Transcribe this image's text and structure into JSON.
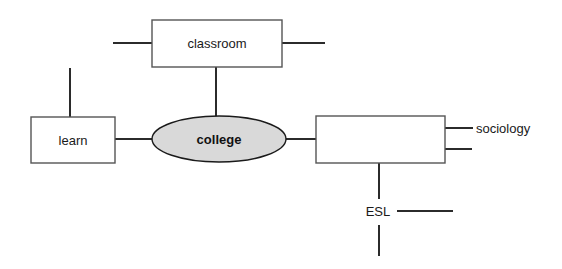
{
  "diagram": {
    "type": "concept-map",
    "canvas": {
      "width": 562,
      "height": 269,
      "background": "#ffffff"
    },
    "colors": {
      "node_fill": "#ffffff",
      "node_stroke": "#555555",
      "central_fill": "#d9d9d9",
      "central_stroke": "#1a1a1a",
      "connector": "#2b2b2b",
      "text": "#1a1a1a"
    },
    "nodes": [
      {
        "id": "classroom",
        "label": "classroom",
        "shape": "rectangle",
        "x": 152,
        "y": 20,
        "w": 130,
        "h": 47,
        "label_x": 217,
        "label_y": 48,
        "bold": false
      },
      {
        "id": "learn",
        "label": "learn",
        "shape": "rectangle",
        "x": 31,
        "y": 117,
        "w": 84,
        "h": 46,
        "label_x": 73,
        "label_y": 145,
        "bold": false
      },
      {
        "id": "college",
        "label": "college",
        "shape": "ellipse",
        "cx": 219,
        "cy": 139,
        "rx": 67,
        "ry": 23,
        "label_x": 219,
        "label_y": 144,
        "bold": true
      },
      {
        "id": "empty-right",
        "label": "",
        "shape": "rectangle",
        "x": 316,
        "y": 116,
        "w": 129,
        "h": 47,
        "label_x": 380,
        "label_y": 144,
        "bold": false
      }
    ],
    "free_labels": [
      {
        "id": "sociology",
        "text": "sociology",
        "x": 476,
        "y": 133,
        "anchor": "start"
      },
      {
        "id": "esl",
        "text": "ESL",
        "x": 378,
        "y": 216,
        "anchor": "middle"
      }
    ],
    "connectors": [
      {
        "id": "classroom-left-stub",
        "x1": 113,
        "y1": 43,
        "x2": 152,
        "y2": 43
      },
      {
        "id": "classroom-right-stub",
        "x1": 282,
        "y1": 43,
        "x2": 325,
        "y2": 43
      },
      {
        "id": "classroom-to-college",
        "x1": 216,
        "y1": 67,
        "x2": 216,
        "y2": 117
      },
      {
        "id": "learn-top-stub",
        "x1": 70,
        "y1": 68,
        "x2": 70,
        "y2": 117
      },
      {
        "id": "learn-to-college",
        "x1": 115,
        "y1": 139,
        "x2": 153,
        "y2": 139
      },
      {
        "id": "college-to-right-box",
        "x1": 285,
        "y1": 139,
        "x2": 317,
        "y2": 139
      },
      {
        "id": "right-box-to-sociology",
        "x1": 445,
        "y1": 128,
        "x2": 473,
        "y2": 128
      },
      {
        "id": "right-box-right-stub",
        "x1": 445,
        "y1": 149,
        "x2": 472,
        "y2": 149
      },
      {
        "id": "right-box-to-esl",
        "x1": 379,
        "y1": 163,
        "x2": 379,
        "y2": 199
      },
      {
        "id": "esl-right-stub",
        "x1": 397,
        "y1": 211,
        "x2": 453,
        "y2": 211
      },
      {
        "id": "esl-bottom-stub",
        "x1": 379,
        "y1": 225,
        "x2": 379,
        "y2": 256
      }
    ]
  }
}
